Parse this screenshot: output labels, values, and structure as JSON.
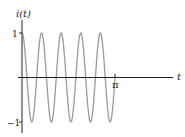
{
  "chart_data": {
    "type": "line",
    "title": "",
    "xlabel": "t",
    "ylabel": "i(t)",
    "function": "i(t) = cos(9.5 t)",
    "x_range": [
      0,
      3.14159
    ],
    "ylim": [
      -1,
      1
    ],
    "x_ticks": [
      {
        "value": 3.14159,
        "label": "π"
      }
    ],
    "y_ticks": [
      {
        "value": 1,
        "label": "1"
      },
      {
        "value": -1,
        "label": "−1"
      }
    ],
    "grid": false,
    "legend": false,
    "series": [
      {
        "name": "i(t)",
        "omega": 9.5,
        "color": "#9a9a9a",
        "peaks_count": 5,
        "troughs_count": 5,
        "end_value": 0
      }
    ]
  },
  "axes": {
    "y_label": "i(t)",
    "x_label": "t",
    "y_tick_pos": "1",
    "y_tick_neg": "−1",
    "x_tick_pi": "π"
  },
  "colors": {
    "axis": "#222222",
    "curve": "#9a9a9a"
  }
}
